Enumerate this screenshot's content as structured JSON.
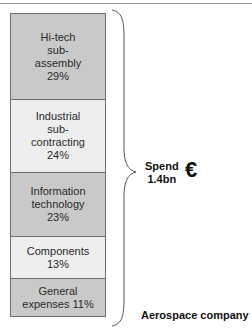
{
  "diagram": {
    "segments": [
      {
        "label": "Hi-tech\nsub-\nassembly\n29%",
        "name": "Hi-tech sub-assembly",
        "percent": 29,
        "color": "#c9c9c9",
        "height": 86
      },
      {
        "label": "Industrial\nsub-\ncontracting\n24%",
        "name": "Industrial sub-contracting",
        "percent": 24,
        "color": "#eeeeee",
        "height": 73
      },
      {
        "label": "Information\ntechnology\n23%",
        "name": "Information technology",
        "percent": 23,
        "color": "#c9c9c9",
        "height": 64
      },
      {
        "label": "Components\n13%",
        "name": "Components",
        "percent": 13,
        "color": "#eeeeee",
        "height": 42
      },
      {
        "label": "General\nexpenses 11%",
        "name": "General expenses",
        "percent": 11,
        "color": "#c9c9c9",
        "height": 37
      }
    ],
    "spend_label": "Spend\n1.4bn",
    "currency_symbol": "€",
    "company_label": "Aerospace company"
  }
}
